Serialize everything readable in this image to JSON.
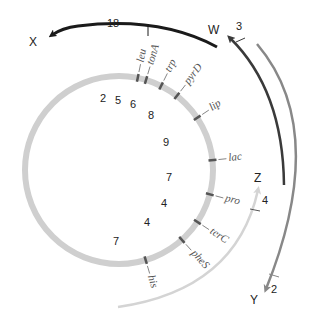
{
  "diagram": {
    "type": "circular-genetic-map",
    "center": [
      119,
      170
    ],
    "radius": 94,
    "colors": {
      "chromosome": "#cfcfcf",
      "marker": "#555555",
      "arc_X": "#1a1a1a",
      "arc_W": "#3a3a3a",
      "arc_Y": "#888888",
      "arc_Z": "#d4d4d4"
    },
    "genes": [
      {
        "name": "leu",
        "angle": -78.5
      },
      {
        "name": "tonA",
        "angle": -73.3
      },
      {
        "name": "trp",
        "angle": -63.4
      },
      {
        "name": "pyrD",
        "angle": -52
      },
      {
        "name": "lip",
        "angle": -33.7
      },
      {
        "name": "lac",
        "angle": -6
      },
      {
        "name": "pro",
        "angle": 15
      },
      {
        "name": "terC",
        "angle": 33.5
      },
      {
        "name": "pheS",
        "angle": 48
      },
      {
        "name": "his",
        "angle": 73.5
      }
    ],
    "intervals": [
      {
        "label": "2",
        "x": 100,
        "y": 102
      },
      {
        "label": "5",
        "x": 115,
        "y": 104
      },
      {
        "label": "6",
        "x": 130,
        "y": 108
      },
      {
        "label": "8",
        "x": 148,
        "y": 119
      },
      {
        "label": "9",
        "x": 163,
        "y": 146
      },
      {
        "label": "7",
        "x": 166,
        "y": 181
      },
      {
        "label": "4",
        "x": 161,
        "y": 207
      },
      {
        "label": "4",
        "x": 144,
        "y": 226
      },
      {
        "label": "7",
        "x": 113,
        "y": 245
      }
    ],
    "arcs": [
      {
        "name": "X",
        "label": "X",
        "distance": "18"
      },
      {
        "name": "W",
        "label": "W",
        "distance": "3"
      },
      {
        "name": "Y",
        "label": "Y",
        "distance": "2"
      },
      {
        "name": "Z",
        "label": "Z",
        "distance": "4"
      }
    ]
  }
}
